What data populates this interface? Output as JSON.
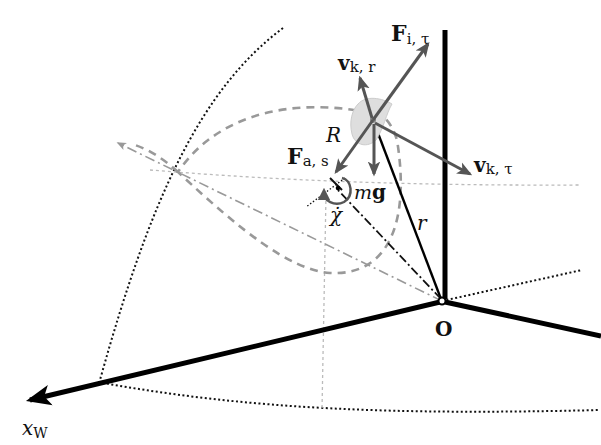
{
  "diagram": {
    "labels": {
      "F_i_tau_main": "F",
      "F_i_tau_sub": "i, τ",
      "v_k_r_main": "v",
      "v_k_r_sub": "k, r",
      "v_k_tau_main": "v",
      "v_k_tau_sub": "k, τ",
      "F_a_s_main": "F",
      "F_a_s_sub": "a, s",
      "R": "R",
      "mg_m": "m",
      "mg_g": "g",
      "chi_dot": "χ̇",
      "r": "r",
      "origin": "O",
      "x_w_main": "x",
      "x_w_sub": "W"
    },
    "colors": {
      "axis": "#000000",
      "vector": "#555555",
      "trajectory": "#999999",
      "guide": "#bbbbbb",
      "mass": "#dddddd"
    }
  }
}
